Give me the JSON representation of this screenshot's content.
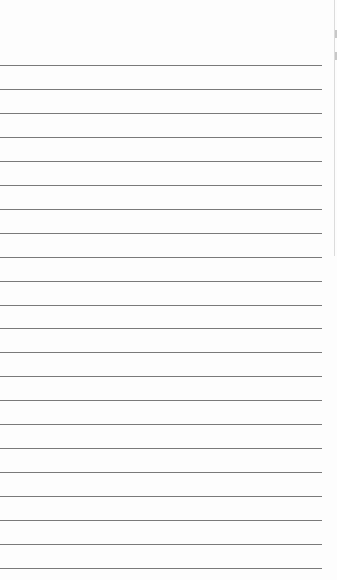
{
  "document": {
    "type": "lined-paper",
    "background_color": "#fdfdfd",
    "rule_color": "#7a7a7a",
    "rule_count": 22,
    "first_rule_y": 65,
    "rule_spacing_px": 24,
    "rule_length_px": 322,
    "text": ""
  },
  "adjacent_page_edge": {
    "color": "#dcdcdc",
    "height_px": 256
  }
}
